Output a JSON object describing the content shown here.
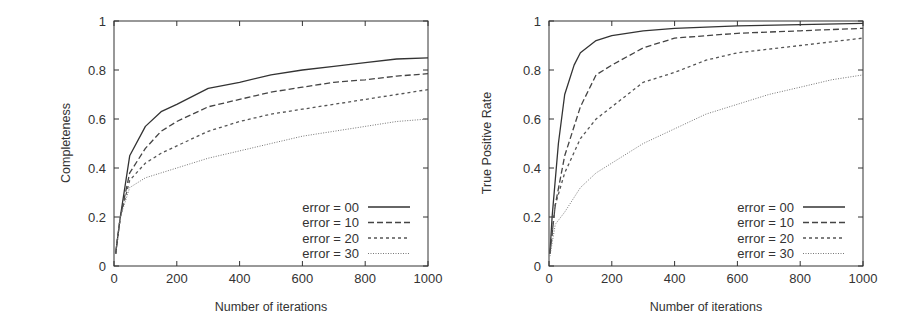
{
  "chart_data": [
    {
      "type": "line",
      "title": "",
      "xlabel": "Number of iterations",
      "ylabel": "Completeness",
      "xlim": [
        0,
        1000
      ],
      "ylim": [
        0,
        1
      ],
      "xticks": [
        "0",
        "200",
        "400",
        "600",
        "800",
        "1000"
      ],
      "yticks": [
        "0",
        "0.2",
        "0.4",
        "0.6",
        "0.8",
        "1"
      ],
      "grid": false,
      "legend_position": "lower right",
      "series": [
        {
          "name": "error = 00",
          "style": "solid",
          "x": [
            5,
            20,
            50,
            100,
            150,
            200,
            300,
            400,
            500,
            600,
            700,
            800,
            900,
            1000
          ],
          "y": [
            0.05,
            0.2,
            0.45,
            0.57,
            0.63,
            0.66,
            0.725,
            0.75,
            0.78,
            0.8,
            0.815,
            0.83,
            0.845,
            0.85
          ]
        },
        {
          "name": "error = 10",
          "style": "dashed",
          "x": [
            5,
            20,
            50,
            100,
            150,
            200,
            300,
            400,
            500,
            600,
            700,
            800,
            900,
            1000
          ],
          "y": [
            0.05,
            0.2,
            0.38,
            0.48,
            0.55,
            0.59,
            0.65,
            0.68,
            0.71,
            0.73,
            0.75,
            0.76,
            0.775,
            0.785
          ]
        },
        {
          "name": "error = 20",
          "style": "short-dashed",
          "x": [
            5,
            20,
            50,
            100,
            150,
            200,
            300,
            400,
            500,
            600,
            700,
            800,
            900,
            1000
          ],
          "y": [
            0.05,
            0.2,
            0.35,
            0.42,
            0.46,
            0.49,
            0.55,
            0.59,
            0.62,
            0.64,
            0.66,
            0.68,
            0.7,
            0.72
          ]
        },
        {
          "name": "error = 30",
          "style": "dotted",
          "x": [
            5,
            20,
            50,
            100,
            150,
            200,
            300,
            400,
            500,
            600,
            700,
            800,
            900,
            1000
          ],
          "y": [
            0.05,
            0.2,
            0.32,
            0.36,
            0.38,
            0.4,
            0.44,
            0.47,
            0.5,
            0.53,
            0.55,
            0.57,
            0.59,
            0.6
          ]
        }
      ]
    },
    {
      "type": "line",
      "title": "",
      "xlabel": "Number of iterations",
      "ylabel": "True Positive Rate",
      "xlim": [
        0,
        1000
      ],
      "ylim": [
        0,
        1
      ],
      "xticks": [
        "0",
        "200",
        "400",
        "600",
        "800",
        "1000"
      ],
      "yticks": [
        "0",
        "0.2",
        "0.4",
        "0.6",
        "0.8",
        "1"
      ],
      "grid": false,
      "legend_position": "lower right",
      "series": [
        {
          "name": "error = 00",
          "style": "solid",
          "x": [
            3,
            10,
            30,
            50,
            80,
            100,
            150,
            200,
            300,
            400,
            600,
            800,
            1000
          ],
          "y": [
            0.05,
            0.2,
            0.5,
            0.7,
            0.82,
            0.87,
            0.92,
            0.94,
            0.96,
            0.97,
            0.98,
            0.985,
            0.99
          ]
        },
        {
          "name": "error = 10",
          "style": "dashed",
          "x": [
            3,
            20,
            50,
            100,
            150,
            200,
            300,
            400,
            500,
            600,
            800,
            1000
          ],
          "y": [
            0.05,
            0.25,
            0.45,
            0.65,
            0.78,
            0.82,
            0.89,
            0.93,
            0.94,
            0.95,
            0.96,
            0.97
          ]
        },
        {
          "name": "error = 20",
          "style": "short-dashed",
          "x": [
            3,
            20,
            50,
            100,
            150,
            200,
            300,
            400,
            500,
            600,
            800,
            1000
          ],
          "y": [
            0.05,
            0.25,
            0.38,
            0.52,
            0.6,
            0.65,
            0.75,
            0.79,
            0.84,
            0.87,
            0.9,
            0.93
          ]
        },
        {
          "name": "error = 30",
          "style": "dotted",
          "x": [
            3,
            20,
            50,
            100,
            150,
            200,
            300,
            400,
            500,
            600,
            700,
            800,
            900,
            1000
          ],
          "y": [
            0.04,
            0.17,
            0.22,
            0.32,
            0.38,
            0.42,
            0.5,
            0.56,
            0.62,
            0.66,
            0.7,
            0.73,
            0.76,
            0.78
          ]
        }
      ]
    }
  ],
  "colors": {
    "axis": "#333333",
    "series": [
      "#333333",
      "#444444",
      "#555555",
      "#777777"
    ]
  }
}
